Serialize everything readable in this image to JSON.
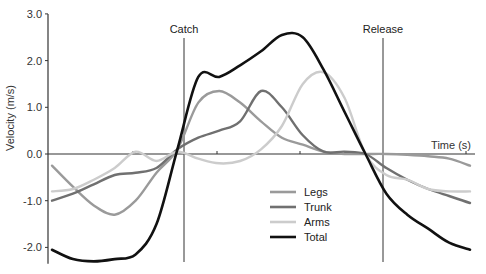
{
  "chart_data": {
    "type": "line",
    "title": "",
    "xlabel": "Time (s)",
    "ylabel": "Velocity (m/s)",
    "ylim": [
      -2.3,
      3.0
    ],
    "yticks": [
      3.0,
      2.0,
      1.0,
      0.0,
      -1.0,
      -2.0
    ],
    "ytick_labels": [
      "3.0",
      "2.0",
      "1.0",
      "0.0",
      "-1.0",
      "-2.0"
    ],
    "grid": false,
    "legend_position": "lower center-right",
    "annotations": [
      {
        "label": "Catch",
        "x": 0.3
      },
      {
        "label": "Release",
        "x": 0.75
      }
    ],
    "x": [
      0.0,
      0.05,
      0.1,
      0.15,
      0.2,
      0.25,
      0.3,
      0.35,
      0.4,
      0.45,
      0.5,
      0.55,
      0.6,
      0.65,
      0.7,
      0.75,
      0.8,
      0.85,
      0.9,
      0.95,
      1.0
    ],
    "series": [
      {
        "name": "Legs",
        "color": "#9a9a9a",
        "values": [
          -0.25,
          -0.7,
          -1.1,
          -1.3,
          -1.0,
          -0.4,
          0.1,
          1.1,
          1.35,
          1.1,
          0.7,
          0.35,
          0.2,
          0.05,
          0.0,
          0.0,
          0.0,
          -0.02,
          -0.05,
          -0.1,
          -0.25
        ]
      },
      {
        "name": "Trunk",
        "color": "#707070",
        "values": [
          -1.0,
          -0.85,
          -0.65,
          -0.45,
          -0.4,
          -0.3,
          0.1,
          0.35,
          0.5,
          0.7,
          1.35,
          1.0,
          0.4,
          0.05,
          0.05,
          0.0,
          -0.3,
          -0.55,
          -0.75,
          -0.9,
          -1.05
        ]
      },
      {
        "name": "Arms",
        "color": "#cccccc",
        "values": [
          -0.8,
          -0.75,
          -0.55,
          -0.3,
          0.05,
          -0.15,
          0.05,
          -0.1,
          -0.2,
          -0.15,
          0.1,
          0.6,
          1.5,
          1.75,
          1.2,
          0.0,
          -0.45,
          -0.55,
          -0.75,
          -0.8,
          -0.8
        ]
      },
      {
        "name": "Total",
        "color": "#111111",
        "values": [
          -2.05,
          -2.25,
          -2.3,
          -2.25,
          -2.15,
          -1.5,
          0.1,
          1.65,
          1.65,
          1.9,
          2.2,
          2.55,
          2.5,
          1.8,
          0.9,
          0.0,
          -0.85,
          -1.3,
          -1.6,
          -1.9,
          -2.05
        ]
      }
    ]
  }
}
